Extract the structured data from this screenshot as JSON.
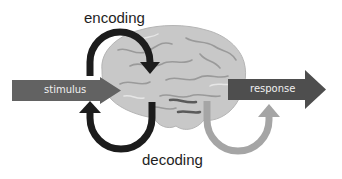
{
  "diagram": {
    "labels": {
      "encoding": "encoding",
      "decoding": "decoding",
      "stimulus": "stimulus",
      "response": "response"
    },
    "nodes": [
      {
        "id": "stimulus",
        "kind": "input-arrow",
        "label": "stimulus"
      },
      {
        "id": "brain",
        "kind": "image",
        "label": "brain"
      },
      {
        "id": "response",
        "kind": "output-arrow",
        "label": "response"
      }
    ],
    "edges": [
      {
        "from": "stimulus",
        "to": "brain",
        "label": "encoding",
        "style": "dark-curved-arrow"
      },
      {
        "from": "brain",
        "to": "stimulus",
        "label": "decoding",
        "style": "dark-curved-arrow"
      },
      {
        "from": "brain",
        "to": "response",
        "label": "decoding",
        "style": "gray-curved-arrow"
      }
    ],
    "colors": {
      "stimulus_arrow": "#626262",
      "response_arrow": "#4e4e4e",
      "dark_loop": "#1c1c1c",
      "gray_loop": "#a5a5a5",
      "brain_fill": "#c9c9c9",
      "brain_detail": "#9a9a9a",
      "text": "#1e1e1e",
      "arrow_text": "#f0f0f0"
    }
  }
}
